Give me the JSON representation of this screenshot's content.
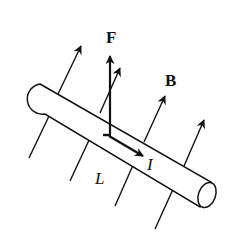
{
  "diagram": {
    "type": "physics-force-on-current-carrying-wire",
    "labels": {
      "force": "F",
      "field": "B",
      "current": "I",
      "length": "L"
    },
    "colors": {
      "stroke": "#111111",
      "background": "#ffffff"
    },
    "elements": {
      "conductor_rod": "cylindrical wire drawn diagonally from upper-left to lower-right",
      "field_arrows_count": 4,
      "field_lines_below_count": 4,
      "force_arrow_direction": "up",
      "current_arrow_direction": "along rod toward lower-right"
    }
  }
}
